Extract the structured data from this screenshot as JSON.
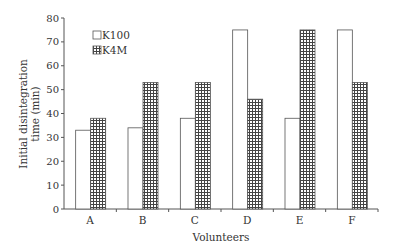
{
  "chart_data": {
    "type": "bar",
    "title": "",
    "xlabel": "Volunteers",
    "ylabel": "Initial disintegration time (min)",
    "ylabel_lines": [
      "Initial disintegration",
      "time (min)"
    ],
    "ylim": [
      0,
      80
    ],
    "yticks": [
      0,
      10,
      20,
      30,
      40,
      50,
      60,
      70,
      80
    ],
    "categories": [
      "A",
      "B",
      "C",
      "D",
      "E",
      "F"
    ],
    "series": [
      {
        "name": "K100",
        "pattern": "white",
        "values": [
          33,
          34,
          38,
          75,
          38,
          75
        ]
      },
      {
        "name": "K4M",
        "pattern": "crosshatch",
        "values": [
          38,
          53,
          53,
          46,
          75,
          53
        ]
      }
    ],
    "legend": {
      "position": "upper-left",
      "entries": [
        "K100",
        "K4M"
      ]
    },
    "grid": false
  },
  "colors": {
    "axis": "#555555",
    "bar_outline": "#555555",
    "hatch": "#444444"
  }
}
